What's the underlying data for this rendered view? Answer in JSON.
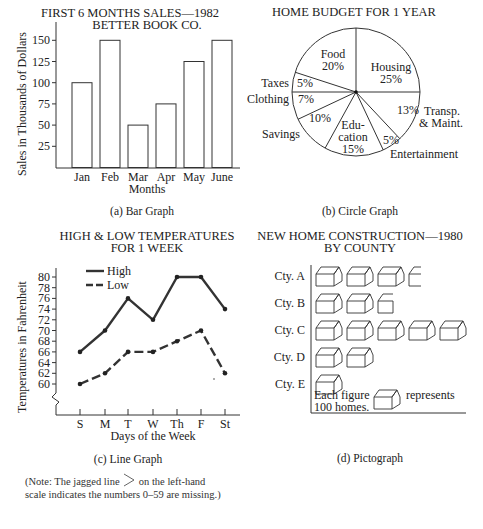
{
  "chart_data": [
    {
      "type": "bar",
      "title": "FIRST 6 MONTHS SALES—1982",
      "subtitle": "BETTER BOOK CO.",
      "xlabel": "Months",
      "ylabel": "Sales in Thousands of Dollars",
      "categories": [
        "Jan",
        "Feb",
        "Mar",
        "Apr",
        "May",
        "June"
      ],
      "values": [
        100,
        150,
        50,
        75,
        125,
        150
      ],
      "yticks": [
        25,
        50,
        75,
        100,
        125,
        150
      ],
      "ylim": [
        0,
        170
      ],
      "grid": false,
      "caption": "(a)  Bar Graph"
    },
    {
      "type": "pie",
      "title": "HOME BUDGET FOR 1 YEAR",
      "slices": [
        {
          "label": "Housing",
          "value": 25
        },
        {
          "label": "Transp. & Maint.",
          "value": 13
        },
        {
          "label": "Entertainment",
          "value": 5
        },
        {
          "label": "Education",
          "value": 15
        },
        {
          "label": "Savings",
          "value": 10
        },
        {
          "label": "Clothing",
          "value": 7
        },
        {
          "label": "Taxes",
          "value": 5
        },
        {
          "label": "Food",
          "value": 20
        }
      ],
      "caption": "(b)  Circle Graph"
    },
    {
      "type": "line",
      "title": "HIGH & LOW TEMPERATURES",
      "subtitle": "FOR 1 WEEK",
      "xlabel": "Days of the Week",
      "ylabel": "Temperatures in Fahrenheit",
      "x": [
        "S",
        "M",
        "T",
        "W",
        "Th",
        "F",
        "St"
      ],
      "series": [
        {
          "name": "High",
          "style": "solid",
          "values": [
            66,
            70,
            76,
            72,
            80,
            80,
            74
          ]
        },
        {
          "name": "Low",
          "style": "dashed",
          "values": [
            60,
            62,
            66,
            66,
            68,
            70,
            62
          ]
        }
      ],
      "yticks": [
        60,
        62,
        64,
        66,
        68,
        70,
        72,
        74,
        76,
        78,
        80
      ],
      "ylim": [
        60,
        80
      ],
      "axis_break": true,
      "legend_position": "top-left",
      "caption": "(c)  Line Graph"
    },
    {
      "type": "pictograph",
      "title": "NEW HOME CONSTRUCTION—1980",
      "subtitle": "BY COUNTY",
      "categories": [
        "Cty. A",
        "Cty. B",
        "Cty. C",
        "Cty. D",
        "Cty. E"
      ],
      "icon_counts": [
        3.5,
        2.75,
        5,
        2,
        1
      ],
      "values": [
        350,
        275,
        500,
        200,
        100
      ],
      "key": {
        "prefix": "Each figure",
        "suffix": "represents",
        "line2": "100 homes.",
        "units_per_icon": 100
      },
      "caption": "(d)  Pictograph"
    }
  ],
  "labels": {
    "bar_title1": "FIRST 6 MONTHS SALES—1982",
    "bar_title2": "BETTER BOOK CO.",
    "bar_ylabel": "Sales in Thousands of Dollars",
    "bar_xlabel": "Months",
    "bar_caption": "(a)  Bar Graph",
    "pie_title": "HOME BUDGET FOR 1 YEAR",
    "pie_caption": "(b)  Circle Graph",
    "pie_food": "Food",
    "pie_food_pct": "20%",
    "pie_housing": "Housing",
    "pie_housing_pct": "25%",
    "pie_taxes": "Taxes",
    "pie_taxes_pct": "5%",
    "pie_clothing": "Clothing",
    "pie_clothing_pct": "7%",
    "pie_savings": "Savings",
    "pie_savings_pct": "10%",
    "pie_edu1": "Edu-",
    "pie_edu2": "cation",
    "pie_edu_pct": "15%",
    "pie_ent_pct": "5%",
    "pie_ent": "Entertainment",
    "pie_transp_pct": "13%",
    "pie_transp1": "Transp.",
    "pie_transp2": "& Maint.",
    "line_title1": "HIGH & LOW TEMPERATURES",
    "line_title2": "FOR 1 WEEK",
    "line_ylabel": "Temperatures in Fahrenheit",
    "line_xlabel": "Days of the Week",
    "line_caption": "(c)  Line Graph",
    "legend_high": "High",
    "legend_low": "Low",
    "pict_title1": "NEW HOME CONSTRUCTION—1980",
    "pict_title2": "BY COUNTY",
    "pict_key1": "Each figure",
    "pict_key2": "represents",
    "pict_key3": "100 homes.",
    "pict_caption": "(d)  Pictograph",
    "note": "(Note: The jagged line",
    "note_rest": "on the left-hand scale indicates the numbers 0–59 are missing.)"
  }
}
